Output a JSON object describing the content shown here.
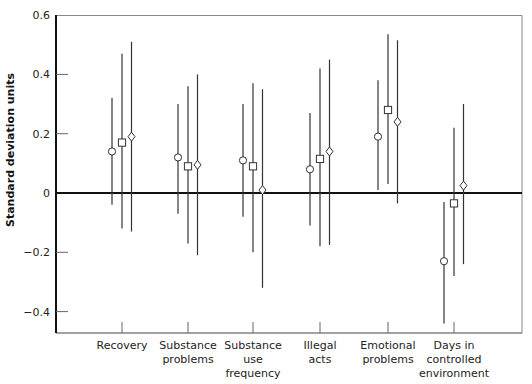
{
  "chart_data": {
    "type": "scatter",
    "subtype": "point-estimate-with-error-bars",
    "title": "",
    "xlabel": "",
    "ylabel": "Standard deviation units",
    "ylim": [
      -0.47,
      0.6
    ],
    "yticks": [
      0.6,
      0.4,
      0.2,
      0,
      -0.2,
      -0.4
    ],
    "ytick_labels": [
      "0.6",
      "0.4",
      "0.2",
      "0",
      "−0.2",
      "−0.4"
    ],
    "grid": false,
    "legend": null,
    "reference_line": 0,
    "categories": [
      [
        "Recovery"
      ],
      [
        "Substance",
        "problems"
      ],
      [
        "Substance",
        "use",
        "frequency"
      ],
      [
        "Illegal",
        "acts"
      ],
      [
        "Emotional",
        "problems"
      ],
      [
        "Days in",
        "controlled",
        "environment"
      ]
    ],
    "series": [
      {
        "name": "circle",
        "marker": "circle",
        "values": [
          0.14,
          0.12,
          0.11,
          0.08,
          0.19,
          -0.23
        ],
        "upper": [
          0.32,
          0.3,
          0.3,
          0.27,
          0.38,
          -0.03
        ],
        "lower": [
          -0.04,
          -0.07,
          -0.08,
          -0.11,
          0.01,
          -0.44
        ]
      },
      {
        "name": "square",
        "marker": "square",
        "values": [
          0.17,
          0.09,
          0.09,
          0.115,
          0.28,
          -0.035
        ],
        "upper": [
          0.47,
          0.36,
          0.37,
          0.42,
          0.535,
          0.22
        ],
        "lower": [
          -0.12,
          -0.17,
          -0.2,
          -0.18,
          0.03,
          -0.28
        ]
      },
      {
        "name": "diamond",
        "marker": "diamond",
        "values": [
          0.19,
          0.095,
          0.01,
          0.14,
          0.24,
          0.025
        ],
        "upper": [
          0.51,
          0.4,
          0.35,
          0.45,
          0.515,
          0.3
        ],
        "lower": [
          -0.13,
          -0.21,
          -0.32,
          -0.175,
          -0.035,
          -0.24
        ]
      }
    ]
  }
}
